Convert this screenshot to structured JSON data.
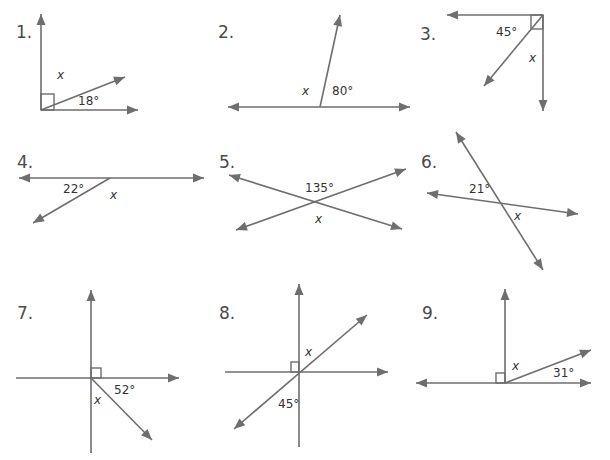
{
  "colors": {
    "line": "#6e6e6e",
    "text": "#333333",
    "number": "#4a4a4a",
    "background": "#ffffff"
  },
  "problems": [
    {
      "number": "1.",
      "number_pos": [
        16,
        22
      ],
      "labels": [
        {
          "text": "x",
          "pos": [
            57,
            68
          ],
          "italic": true
        },
        {
          "text": "18°",
          "pos": [
            78,
            94
          ],
          "italic": false
        }
      ],
      "segments": [
        {
          "from": [
            41,
            110
          ],
          "to": [
            41,
            14
          ],
          "arrow_end": true,
          "arrow_start": false
        },
        {
          "from": [
            41,
            110
          ],
          "to": [
            138,
            110
          ],
          "arrow_end": true,
          "arrow_start": false
        },
        {
          "from": [
            41,
            110
          ],
          "to": [
            125,
            77
          ],
          "arrow_end": true,
          "arrow_start": false
        }
      ],
      "right_angles": [
        {
          "x": 41,
          "y": 94,
          "w": 13,
          "h": 16
        }
      ]
    },
    {
      "number": "2.",
      "number_pos": [
        218,
        22
      ],
      "labels": [
        {
          "text": "x",
          "pos": [
            302,
            84
          ],
          "italic": true
        },
        {
          "text": "80°",
          "pos": [
            332,
            84
          ],
          "italic": false
        }
      ],
      "segments": [
        {
          "from": [
            228,
            107
          ],
          "to": [
            410,
            107
          ],
          "arrow_end": true,
          "arrow_start": true
        },
        {
          "from": [
            320,
            107
          ],
          "to": [
            340,
            15
          ],
          "arrow_end": true,
          "arrow_start": false
        }
      ],
      "right_angles": []
    },
    {
      "number": "3.",
      "number_pos": [
        420,
        24
      ],
      "labels": [
        {
          "text": "45°",
          "pos": [
            496,
            25
          ],
          "italic": false
        },
        {
          "text": "x",
          "pos": [
            529,
            51
          ],
          "italic": true
        }
      ],
      "segments": [
        {
          "from": [
            543,
            15
          ],
          "to": [
            447,
            15
          ],
          "arrow_end": true,
          "arrow_start": false
        },
        {
          "from": [
            543,
            15
          ],
          "to": [
            543,
            111
          ],
          "arrow_end": true,
          "arrow_start": false
        },
        {
          "from": [
            543,
            15
          ],
          "to": [
            484,
            86
          ],
          "arrow_end": true,
          "arrow_start": false
        }
      ],
      "right_angles": [
        {
          "x": 531,
          "y": 15,
          "w": 12,
          "h": 14,
          "diagonal": true
        }
      ]
    },
    {
      "number": "4.",
      "number_pos": [
        17,
        152
      ],
      "labels": [
        {
          "text": "22°",
          "pos": [
            63,
            182
          ],
          "italic": false
        },
        {
          "text": "x",
          "pos": [
            110,
            188
          ],
          "italic": true
        }
      ],
      "segments": [
        {
          "from": [
            19,
            178
          ],
          "to": [
            204,
            178
          ],
          "arrow_end": true,
          "arrow_start": true
        },
        {
          "from": [
            110,
            178
          ],
          "to": [
            33,
            223
          ],
          "arrow_end": true,
          "arrow_start": false
        }
      ],
      "right_angles": []
    },
    {
      "number": "5.",
      "number_pos": [
        219,
        152
      ],
      "labels": [
        {
          "text": "135°",
          "pos": [
            305,
            181
          ],
          "italic": false
        },
        {
          "text": "x",
          "pos": [
            315,
            212
          ],
          "italic": true
        }
      ],
      "segments": [
        {
          "from": [
            229,
            175
          ],
          "to": [
            402,
            229
          ],
          "arrow_end": true,
          "arrow_start": true
        },
        {
          "from": [
            236,
            230
          ],
          "to": [
            406,
            169
          ],
          "arrow_end": true,
          "arrow_start": true
        }
      ],
      "right_angles": []
    },
    {
      "number": "6.",
      "number_pos": [
        421,
        152
      ],
      "labels": [
        {
          "text": "21°",
          "pos": [
            469,
            182
          ],
          "italic": false
        },
        {
          "text": "x",
          "pos": [
            514,
            209
          ],
          "italic": true
        }
      ],
      "segments": [
        {
          "from": [
            456,
            132
          ],
          "to": [
            543,
            270
          ],
          "arrow_end": true,
          "arrow_start": true
        },
        {
          "from": [
            427,
            193
          ],
          "to": [
            578,
            214
          ],
          "arrow_end": true,
          "arrow_start": true
        }
      ],
      "right_angles": []
    },
    {
      "number": "7.",
      "number_pos": [
        17,
        303
      ],
      "labels": [
        {
          "text": "52°",
          "pos": [
            114,
            383
          ],
          "italic": false
        },
        {
          "text": "x",
          "pos": [
            94,
            393
          ],
          "italic": true
        }
      ],
      "segments": [
        {
          "from": [
            91,
            378
          ],
          "to": [
            91,
            290
          ],
          "arrow_end": true,
          "arrow_start": false
        },
        {
          "from": [
            91,
            378
          ],
          "to": [
            91,
            453
          ],
          "arrow_end": false,
          "arrow_start": false
        },
        {
          "from": [
            16,
            378
          ],
          "to": [
            179,
            378
          ],
          "arrow_end": true,
          "arrow_start": false
        },
        {
          "from": [
            91,
            378
          ],
          "to": [
            152,
            440
          ],
          "arrow_end": true,
          "arrow_start": false
        }
      ],
      "right_angles": [
        {
          "x": 91,
          "y": 368,
          "w": 10,
          "h": 10
        }
      ]
    },
    {
      "number": "8.",
      "number_pos": [
        219,
        303
      ],
      "labels": [
        {
          "text": "x",
          "pos": [
            305,
            345
          ],
          "italic": true
        },
        {
          "text": "45°",
          "pos": [
            278,
            397
          ],
          "italic": false
        }
      ],
      "segments": [
        {
          "from": [
            299,
            372
          ],
          "to": [
            299,
            284
          ],
          "arrow_end": true,
          "arrow_start": false
        },
        {
          "from": [
            299,
            372
          ],
          "to": [
            299,
            447
          ],
          "arrow_end": false,
          "arrow_start": false
        },
        {
          "from": [
            225,
            372
          ],
          "to": [
            388,
            372
          ],
          "arrow_end": true,
          "arrow_start": false
        },
        {
          "from": [
            234,
            429
          ],
          "to": [
            367,
            315
          ],
          "arrow_end": true,
          "arrow_start": true
        }
      ],
      "right_angles": [
        {
          "x": 291,
          "y": 362,
          "w": 8,
          "h": 10
        }
      ]
    },
    {
      "number": "9.",
      "number_pos": [
        422,
        303
      ],
      "labels": [
        {
          "text": "x",
          "pos": [
            512,
            359
          ],
          "italic": true
        },
        {
          "text": "31°",
          "pos": [
            553,
            366
          ],
          "italic": false
        }
      ],
      "segments": [
        {
          "from": [
            416,
            383
          ],
          "to": [
            591,
            383
          ],
          "arrow_end": true,
          "arrow_start": true
        },
        {
          "from": [
            505,
            383
          ],
          "to": [
            505,
            289
          ],
          "arrow_end": true,
          "arrow_start": false
        },
        {
          "from": [
            505,
            383
          ],
          "to": [
            591,
            350
          ],
          "arrow_end": true,
          "arrow_start": false
        }
      ],
      "right_angles": [
        {
          "x": 496,
          "y": 373,
          "w": 9,
          "h": 10
        }
      ]
    }
  ]
}
